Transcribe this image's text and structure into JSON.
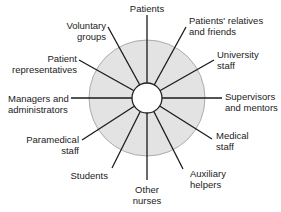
{
  "diagram": {
    "type": "radial-spoke",
    "center": {
      "x": 147,
      "y": 98
    },
    "outer_circle": {
      "radius": 58,
      "fill": "#e3e3e3",
      "stroke": "#9a9a9a"
    },
    "inner_circle": {
      "radius": 15,
      "fill": "#ffffff",
      "stroke": "#222222"
    },
    "spoke_color": "#1a1a1a",
    "nodes": [
      {
        "id": "patients",
        "line1": "Patients",
        "line2": ""
      },
      {
        "id": "patients-relatives",
        "line1": "Patients' relatives",
        "line2": "and friends"
      },
      {
        "id": "university-staff",
        "line1": "University",
        "line2": "staff"
      },
      {
        "id": "supervisors",
        "line1": "Supervisors",
        "line2": "and mentors"
      },
      {
        "id": "medical-staff",
        "line1": "Medical",
        "line2": "staff"
      },
      {
        "id": "auxiliary-helpers",
        "line1": "Auxiliary",
        "line2": "helpers"
      },
      {
        "id": "other-nurses",
        "line1": "Other",
        "line2": "nurses"
      },
      {
        "id": "students",
        "line1": "Students",
        "line2": ""
      },
      {
        "id": "paramedical-staff",
        "line1": "Paramedical",
        "line2": "staff"
      },
      {
        "id": "managers",
        "line1": "Managers and",
        "line2": "administrators"
      },
      {
        "id": "patient-representatives",
        "line1": "Patient",
        "line2": "representatives"
      },
      {
        "id": "voluntary-groups",
        "line1": "Voluntary",
        "line2": "groups"
      }
    ]
  }
}
